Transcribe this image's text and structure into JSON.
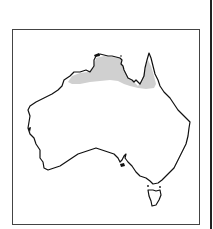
{
  "figure": {
    "type": "distribution-map",
    "region": "Australia",
    "shaded_range": {
      "description": "Northern tropical coast: Kimberley, Top End, Gulf of Carpentaria and base of Cape York Peninsula",
      "fill_color": "#d0d0d0"
    },
    "outline_color": "#111111",
    "frame_color": "#444444",
    "background_color": "#ffffff"
  }
}
